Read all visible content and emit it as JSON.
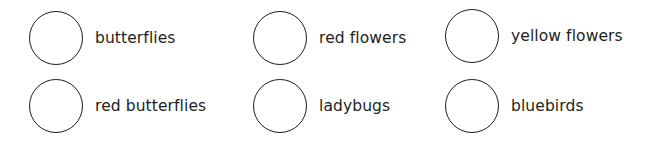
{
  "options": [
    {
      "label": "butterflies"
    },
    {
      "label": "red flowers"
    },
    {
      "label": "yellow flowers"
    },
    {
      "label": "red butterflies"
    },
    {
      "label": "ladybugs"
    },
    {
      "label": "bluebirds"
    }
  ],
  "colors": {
    "stroke": "#231f20",
    "background": "#ffffff"
  }
}
